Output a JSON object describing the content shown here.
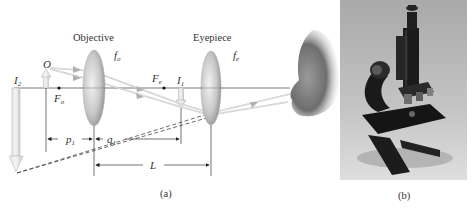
{
  "panel_a": {
    "labels": {
      "objective": "Objective",
      "eyepiece": "Eyepiece",
      "f_o": "f",
      "f_o_sub": "o",
      "f_e": "f",
      "f_e_sub": "e",
      "object": "O",
      "image2": "I",
      "image2_sub": "2",
      "image1": "I",
      "image1_sub": "1",
      "focal_o": "F",
      "focal_o_sub": "o",
      "focal_e": "F",
      "focal_e_sub": "e",
      "p1": "p",
      "p1_sub": "1",
      "q1": "q",
      "q1_sub": "1",
      "L": "L"
    },
    "caption": "(a)"
  },
  "panel_b": {
    "subject": "compound light microscope photograph",
    "caption": "(b)"
  }
}
